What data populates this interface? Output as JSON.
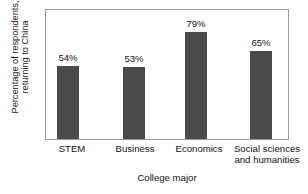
{
  "chart_data": {
    "type": "bar",
    "title": "",
    "categories": [
      "STEM",
      "Business",
      "Economics",
      "Social sciences and humanities"
    ],
    "category_lines": [
      [
        "STEM"
      ],
      [
        "Business"
      ],
      [
        "Economics"
      ],
      [
        "Social sciences",
        "and humanities"
      ]
    ],
    "values": [
      54,
      53,
      79,
      65
    ],
    "value_labels": [
      "54%",
      "53%",
      "79%",
      "65%"
    ],
    "xlabel": "College major",
    "ylabel": "Percentage of respondents, returning to China",
    "ylabel_lines": [
      "Percentage of respondents,",
      "returning to China"
    ],
    "ylim": [
      0,
      95
    ],
    "grid": false,
    "legend": false,
    "axis_ticks_visible": false,
    "series": [
      {
        "name": "Percentage of respondents returning to China",
        "values": [
          54,
          53,
          79,
          65
        ]
      }
    ]
  },
  "style": {
    "bar_color": "#4a4a4a",
    "frame_color": "#9a9a9a",
    "text_color": "#111111",
    "background": "#ffffff"
  }
}
